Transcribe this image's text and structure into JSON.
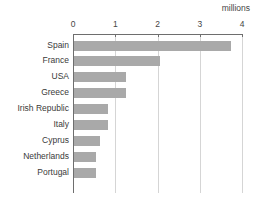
{
  "chart_data": {
    "type": "bar",
    "orientation": "horizontal",
    "title": "",
    "xlabel": "millions",
    "ylabel": "",
    "unit_label": "millions",
    "categories": [
      "Spain",
      "France",
      "USA",
      "Greece",
      "Irish Republic",
      "Italy",
      "Cyprus",
      "Netherlands",
      "Portugal"
    ],
    "values": [
      3.74,
      2.07,
      1.25,
      1.25,
      0.82,
      0.82,
      0.65,
      0.55,
      0.55
    ],
    "xlim": [
      0,
      4
    ],
    "xticks": [
      0,
      1,
      2,
      3,
      4
    ],
    "xtick_labels": [
      "0",
      "1",
      "2",
      "3",
      "4"
    ],
    "grid": true,
    "grid_axis": "x",
    "legend": false,
    "bar_color": "#a9a9a9",
    "axis_color": "#6e6e6e",
    "gridline_color": "#d5d5d5",
    "text_color": "#3a3a3a"
  }
}
